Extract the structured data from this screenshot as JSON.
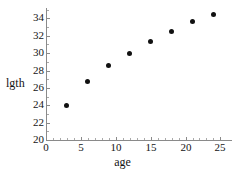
{
  "chart_data": {
    "type": "scatter",
    "title": "",
    "subtitle": "",
    "xlabel": "age",
    "ylabel": "lgth",
    "xlim": [
      0,
      25.8
    ],
    "ylim": [
      20,
      35.2
    ],
    "grid": false,
    "legend": null,
    "marker": {
      "shape": "circle",
      "filled": true,
      "color": "#111111",
      "size_px": 5
    },
    "axis_color": "#8a8a8a",
    "background": "#ffffff",
    "xticks": [
      0,
      5,
      10,
      15,
      20,
      25
    ],
    "xtick_labels": [
      "0",
      "5",
      "10",
      "15",
      "20",
      "25"
    ],
    "xticks_minor": [
      1,
      2,
      3,
      4,
      6,
      7,
      8,
      9,
      11,
      12,
      13,
      14,
      16,
      17,
      18,
      19,
      21,
      22,
      23,
      24,
      25
    ],
    "yticks": [
      20,
      22,
      24,
      26,
      28,
      30,
      32,
      34
    ],
    "ytick_labels": [
      "20",
      "22",
      "24",
      "26",
      "28",
      "30",
      "32",
      "34"
    ],
    "yticks_minor": [
      21,
      23,
      25,
      27,
      29,
      31,
      33,
      35
    ],
    "x": [
      3,
      6,
      9,
      12,
      15,
      18,
      21,
      24
    ],
    "y": [
      24.0,
      26.7,
      28.6,
      30.0,
      31.3,
      32.5,
      33.6,
      34.5
    ],
    "points": [
      {
        "x": 3,
        "y": 24.0
      },
      {
        "x": 6,
        "y": 26.7
      },
      {
        "x": 9,
        "y": 28.6
      },
      {
        "x": 12,
        "y": 30.0
      },
      {
        "x": 15,
        "y": 31.3
      },
      {
        "x": 18,
        "y": 32.5
      },
      {
        "x": 21,
        "y": 33.6
      },
      {
        "x": 24,
        "y": 34.5
      }
    ]
  }
}
